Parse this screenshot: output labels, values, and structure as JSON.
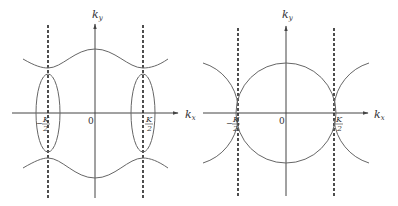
{
  "figure": {
    "panels": [
      {
        "id": "left",
        "x_axis_label": "k",
        "x_axis_sub": "x",
        "y_axis_label": "k",
        "y_axis_sub": "y",
        "origin_label": "0",
        "left_boundary_label": "−K/2",
        "left_boundary_num": "K",
        "left_boundary_den": "2",
        "left_boundary_sign": "−",
        "right_boundary_num": "K",
        "right_boundary_den": "2",
        "description": "Wavy upper/lower bands with ellipses centered at ±K/2"
      },
      {
        "id": "right",
        "x_axis_label": "k",
        "x_axis_sub": "x",
        "y_axis_label": "k",
        "y_axis_sub": "y",
        "origin_label": "0",
        "left_boundary_num": "K",
        "left_boundary_den": "2",
        "left_boundary_sign": "−",
        "right_boundary_num": "K",
        "right_boundary_den": "2",
        "description": "Central circle touching ±K/2 boundaries with neighboring circle arcs"
      }
    ],
    "colors": {
      "line": "#555555",
      "dashed": "#222222",
      "axis": "#444444"
    }
  }
}
